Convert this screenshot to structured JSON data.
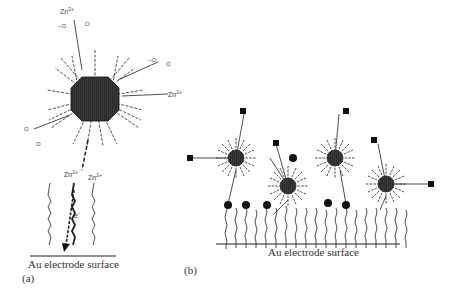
{
  "panel_a": {
    "label": "(a)",
    "surface_label": "Au electrode surface",
    "ions": [
      "Zn2+",
      "Zn2+",
      "Zn2+",
      "Zn2+"
    ],
    "electron_label": "e−",
    "carboxylate_labels": [
      "−O",
      "O"
    ]
  },
  "panel_b": {
    "label": "(b)",
    "surface_label": "Au electrode surface",
    "legend_shapes": [
      "square-terminal-group",
      "circle-terminal-group"
    ]
  },
  "colors": {
    "ink": "#1a1a1a",
    "nanoparticle": "#333333",
    "background": "#ffffff"
  }
}
